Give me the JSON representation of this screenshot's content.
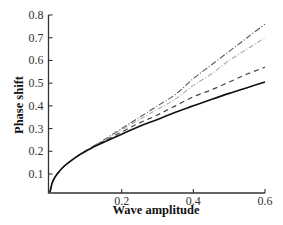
{
  "chart_data": {
    "type": "line",
    "title": "",
    "xlabel": "Wave amplitude",
    "ylabel": "Phase shift",
    "xlim": [
      0,
      0.6
    ],
    "ylim": [
      0.016,
      0.8
    ],
    "x_ticks": [
      0.2,
      0.4,
      0.6
    ],
    "x_tick_labels": [
      "0.2",
      "0.4",
      "0.6"
    ],
    "y_ticks": [
      0.1,
      0.2,
      0.3,
      0.4,
      0.5,
      0.6,
      0.7,
      0.8
    ],
    "y_tick_labels": [
      "0.1",
      "0.2",
      "0.3",
      "0.4",
      "0.5",
      "0.6",
      "0.7",
      "0.8"
    ],
    "grid": false,
    "legend": null,
    "x": [
      0,
      0.005,
      0.01,
      0.02,
      0.04,
      0.06,
      0.08,
      0.1,
      0.125,
      0.15,
      0.2,
      0.25,
      0.3,
      0.35,
      0.4,
      0.45,
      0.5,
      0.55,
      0.6
    ],
    "series": [
      {
        "name": "curve-1 (dash-dot, dark gray)",
        "style": "dashdot",
        "color": "#555555",
        "values": [
          0.02,
          0.055,
          0.075,
          0.1,
          0.135,
          0.16,
          0.182,
          0.202,
          0.226,
          0.25,
          0.3,
          0.35,
          0.4,
          0.45,
          0.52,
          0.58,
          0.64,
          0.7,
          0.76
        ]
      },
      {
        "name": "curve-2 (dash-dot, light gray)",
        "style": "dashdot-light",
        "color": "#aaaaaa",
        "values": [
          0.02,
          0.055,
          0.075,
          0.1,
          0.135,
          0.16,
          0.182,
          0.202,
          0.226,
          0.248,
          0.295,
          0.34,
          0.385,
          0.43,
          0.49,
          0.54,
          0.6,
          0.65,
          0.7
        ]
      },
      {
        "name": "curve-3 (dashed)",
        "style": "dashed",
        "color": "#444444",
        "values": [
          0.02,
          0.055,
          0.075,
          0.1,
          0.135,
          0.16,
          0.182,
          0.202,
          0.224,
          0.244,
          0.285,
          0.325,
          0.36,
          0.4,
          0.44,
          0.47,
          0.505,
          0.54,
          0.57
        ]
      },
      {
        "name": "curve-4 (solid)",
        "style": "solid",
        "color": "#111111",
        "values": [
          0.02,
          0.055,
          0.075,
          0.1,
          0.135,
          0.16,
          0.182,
          0.2,
          0.222,
          0.24,
          0.275,
          0.31,
          0.34,
          0.372,
          0.4,
          0.428,
          0.455,
          0.48,
          0.505
        ]
      }
    ]
  },
  "plot_area": {
    "px_x0": 50,
    "px_x1": 265,
    "px_y_at_0": 196.7,
    "px_per_unit_y": 227.1,
    "axis_baseline_px": 193
  }
}
